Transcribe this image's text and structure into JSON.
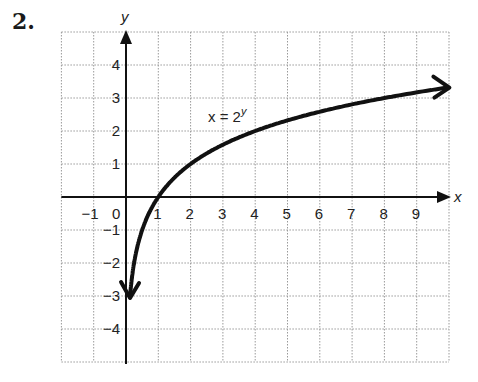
{
  "problem": {
    "number": "2."
  },
  "chart_data": {
    "type": "line",
    "title": "",
    "equation_label": "x = 2^y",
    "equation_base": "x = 2",
    "equation_exp": "y",
    "xlabel": "x",
    "ylabel": "y",
    "xlim": [
      -2,
      10
    ],
    "ylim": [
      -5,
      5
    ],
    "grid": true,
    "grid_style": "dotted",
    "x_ticks": [
      "-1",
      "0",
      "1",
      "2",
      "3",
      "4",
      "5",
      "6",
      "7",
      "8",
      "9"
    ],
    "y_ticks": [
      "4",
      "3",
      "2",
      "1",
      "-1",
      "-2",
      "-3",
      "-4"
    ],
    "series": [
      {
        "name": "x = 2^y",
        "arrows": "both ends",
        "points": [
          {
            "x": 0.125,
            "y": -3
          },
          {
            "x": 0.25,
            "y": -2
          },
          {
            "x": 0.5,
            "y": -1
          },
          {
            "x": 1,
            "y": 0
          },
          {
            "x": 2,
            "y": 1
          },
          {
            "x": 4,
            "y": 2
          },
          {
            "x": 8,
            "y": 3
          },
          {
            "x": 10,
            "y": 3.32
          }
        ]
      }
    ],
    "colors": {
      "curve": "#111111",
      "axis": "#111111",
      "grid": "#9a9a9a"
    }
  }
}
